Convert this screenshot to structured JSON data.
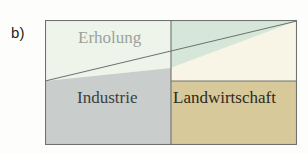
{
  "figure": {
    "panel_letter": "b)",
    "background_color": "#fdfdfc",
    "box": {
      "border_color": "#8a8f8c",
      "x": 45,
      "y": 20,
      "width": 252,
      "height": 125
    }
  },
  "regions": [
    {
      "key": "erholung",
      "label": "Erholung",
      "fill_color": "#eef4ea",
      "label_color": "#9aa29b",
      "position": "upper-left"
    },
    {
      "key": "industrie",
      "label": "Industrie",
      "fill_color": "#c9cdcb",
      "label_color": "#3b3f3d",
      "position": "lower-left"
    },
    {
      "key": "erholung_right",
      "label": "",
      "fill_color": "#d6e7d9",
      "label_color": "",
      "position": "upper-right-triangle"
    },
    {
      "key": "cream_band",
      "label": "",
      "fill_color": "#f8f5e6",
      "label_color": "",
      "position": "right-middle-band"
    },
    {
      "key": "landwirtschaft",
      "label": "Landwirtschaft",
      "fill_color": "#d8c99a",
      "label_color": "#2e2a20",
      "position": "lower-right"
    }
  ],
  "dividers": {
    "vertical_x": 126,
    "right_horizontal_y": 61,
    "diagonal": {
      "left_y": 61,
      "mid_y": 48,
      "right_y": 1
    },
    "line_color": "#6e726f"
  }
}
